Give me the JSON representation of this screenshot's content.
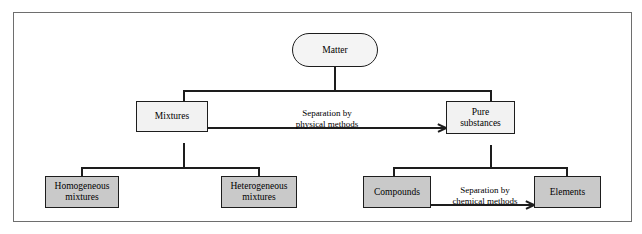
{
  "diagram": {
    "type": "flowchart",
    "colors": {
      "frame_border": "#6e6e6e",
      "node_border": "#1d1d1d",
      "root_fill": "#f4f4f4",
      "level1_fill": "#f2f2f2",
      "level2_fill": "#c9c9c9",
      "edge": "#1d1d1d",
      "text": "#000000",
      "background": "#ffffff"
    },
    "nodes": {
      "matter": "Matter",
      "mixtures": "Mixtures",
      "pure_substances": "Pure\nsubstances",
      "homogeneous_mixtures": "Homogeneous\nmixtures",
      "heterogeneous_mixtures": "Heterogeneous\nmixtures",
      "compounds": "Compounds",
      "elements": "Elements"
    },
    "edge_labels": {
      "physical_separation": "Separation by\nphysical methods",
      "chemical_separation": "Separation by\nchemical methods"
    }
  }
}
